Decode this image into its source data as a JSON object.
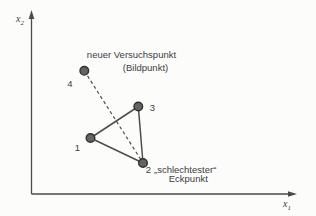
{
  "figure": {
    "width": 316,
    "height": 216,
    "point_radius": 4.3,
    "colors": {
      "background": "#fcfcfb",
      "axis": "#4a4a4a",
      "edge": "#4d4d4d",
      "point_fill": "#646464",
      "point_stroke": "#2f2f2f",
      "text": "#3d3d3d"
    },
    "axes": {
      "origin": {
        "x": 31.5,
        "y": 194
      },
      "y_tip": 10,
      "x_tip": 297,
      "x_label": {
        "base": "x",
        "sub": "1",
        "x": 283,
        "y": 207
      },
      "y_label": {
        "base": "x",
        "sub": "2",
        "x": 16,
        "y": 22
      }
    },
    "points": [
      {
        "label": "1",
        "x": 90.5,
        "y": 138,
        "lx": 77.5,
        "ly": 150.5
      },
      {
        "label": "2",
        "x": 143,
        "y": 163,
        "lx": 148.5,
        "ly": 173
      },
      {
        "label": "3",
        "x": 138.3,
        "y": 106.5,
        "lx": 152.5,
        "ly": 110.5
      },
      {
        "label": "4",
        "x": 84.3,
        "y": 70.8,
        "lx": 70,
        "ly": 86.5
      }
    ],
    "solid_edges": [
      [
        0,
        1
      ],
      [
        1,
        2
      ],
      [
        2,
        0
      ]
    ],
    "dashed_edges": [
      [
        3,
        1
      ]
    ],
    "annotations": [
      {
        "text": "neuer Versuchspunkt",
        "x": 131.5,
        "y": 58,
        "anchor": "middle"
      },
      {
        "text": "(Bildpunkt)",
        "x": 145.5,
        "y": 70.5,
        "anchor": "middle"
      },
      {
        "text": "„schlechtester“",
        "x": 154,
        "y": 173,
        "anchor": "start"
      },
      {
        "text": "Eckpunkt",
        "x": 188.3,
        "y": 181.5,
        "anchor": "middle"
      }
    ]
  }
}
